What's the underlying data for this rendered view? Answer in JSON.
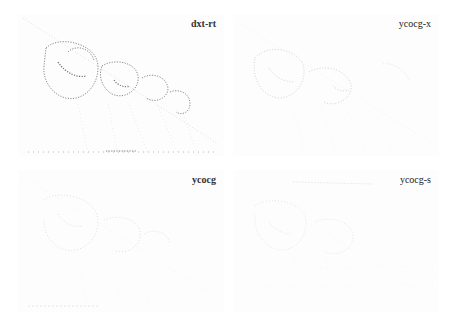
{
  "figure": {
    "panels": [
      {
        "id": "dxt-rt",
        "label": "dxt-rt",
        "position": "top-left",
        "stroke": "#555555",
        "opacity": 0.85
      },
      {
        "id": "ycocg-x",
        "label": "ycocg-x",
        "position": "top-right",
        "stroke": "#8a8a8a",
        "opacity": 0.5
      },
      {
        "id": "ycocg",
        "label": "ycocg",
        "position": "bottom-left",
        "stroke": "#9a9a9a",
        "opacity": 0.4
      },
      {
        "id": "ycocg-s",
        "label": "ycocg-s",
        "position": "bottom-right",
        "stroke": "#a5a5a5",
        "opacity": 0.35
      }
    ]
  }
}
